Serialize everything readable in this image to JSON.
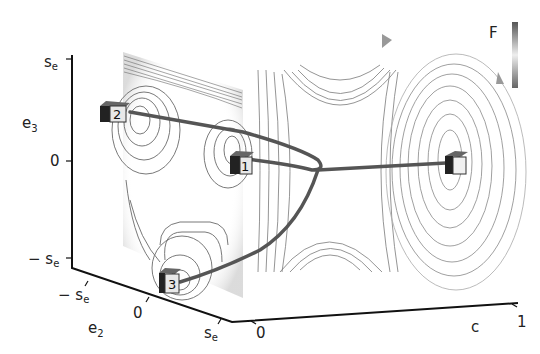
{
  "diagram": {
    "colorbar_label": "F",
    "axes": {
      "e3": {
        "label": "e",
        "subscript": "3",
        "ticks": [
          {
            "text": "s",
            "sub": "e"
          },
          {
            "text": "0",
            "sub": ""
          },
          {
            "text": "− s",
            "sub": "e"
          }
        ]
      },
      "e2": {
        "label": "e",
        "subscript": "2",
        "ticks": [
          {
            "text": "− s",
            "sub": "e"
          },
          {
            "text": "0",
            "sub": ""
          },
          {
            "text": "s",
            "sub": "e"
          }
        ]
      },
      "c": {
        "label": "c",
        "ticks": [
          {
            "text": "0"
          },
          {
            "text": "1"
          }
        ]
      }
    },
    "minima": [
      {
        "id": "1",
        "label": "1"
      },
      {
        "id": "2",
        "label": "2"
      },
      {
        "id": "3",
        "label": "3"
      },
      {
        "id": "4",
        "label": ""
      }
    ],
    "colors": {
      "contour": "#6a6a6a",
      "path": "#555555",
      "axis": "#111111"
    }
  }
}
